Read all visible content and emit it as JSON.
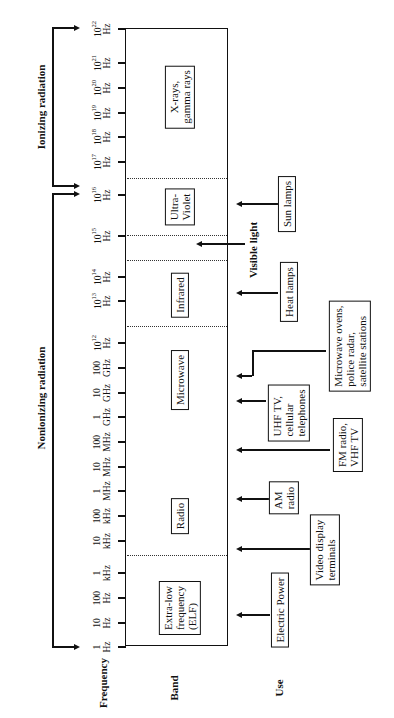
{
  "diagram": {
    "column_headers": {
      "frequency": "Frequency",
      "band": "Band",
      "use": "Use"
    },
    "radiation_groups": [
      {
        "label": "Ionizing radiation",
        "from": "10^16 Hz",
        "to": "10^22 Hz"
      },
      {
        "label": "Nonionizing radiation",
        "from": "1 Hz",
        "to": "10^16 Hz"
      }
    ],
    "frequency_ticks": [
      {
        "top": "10",
        "sup": "22",
        "unit": "Hz",
        "y": 28
      },
      {
        "top": "10",
        "sup": "21",
        "unit": "Hz",
        "y": 62
      },
      {
        "top": "10",
        "sup": "20",
        "unit": "Hz",
        "y": 87
      },
      {
        "top": "10",
        "sup": "19",
        "unit": "Hz",
        "y": 112
      },
      {
        "top": "10",
        "sup": "18",
        "unit": "Hz",
        "y": 136
      },
      {
        "top": "10",
        "sup": "17",
        "unit": "Hz",
        "y": 161
      },
      {
        "top": "10",
        "sup": "16",
        "unit": "Hz",
        "y": 194
      },
      {
        "top": "10",
        "sup": "15",
        "unit": "Hz",
        "y": 235
      },
      {
        "top": "10",
        "sup": "14",
        "unit": "Hz",
        "y": 276
      },
      {
        "top": "10",
        "sup": "13",
        "unit": "Hz",
        "y": 300
      },
      {
        "top": "10",
        "sup": "12",
        "unit": "Hz",
        "y": 342
      },
      {
        "top": "100",
        "sup": "",
        "unit": "GHz",
        "y": 367
      },
      {
        "top": "10",
        "sup": "",
        "unit": "GHz",
        "y": 392
      },
      {
        "top": "1",
        "sup": "",
        "unit": "GHz",
        "y": 416
      },
      {
        "top": "100",
        "sup": "",
        "unit": "MHz",
        "y": 441
      },
      {
        "top": "10",
        "sup": "",
        "unit": "MHz",
        "y": 466
      },
      {
        "top": "1",
        "sup": "",
        "unit": "MHz",
        "y": 490
      },
      {
        "top": "100",
        "sup": "",
        "unit": "kHz",
        "y": 515
      },
      {
        "top": "10",
        "sup": "",
        "unit": "kHz",
        "y": 540
      },
      {
        "top": "1",
        "sup": "",
        "unit": "kHz",
        "y": 572
      },
      {
        "top": "100",
        "sup": "",
        "unit": "Hz",
        "y": 597
      },
      {
        "top": "10",
        "sup": "",
        "unit": "Hz",
        "y": 622
      },
      {
        "top": "1",
        "sup": "",
        "unit": "Hz",
        "y": 646
      }
    ],
    "bands": [
      {
        "label": "X-rays, gamma rays",
        "line1": "X-rays,",
        "line2": "gamma rays"
      },
      {
        "label": "Ultra-Violet",
        "line1": "Ultra-",
        "line2": "Violet"
      },
      {
        "label": "Infrared",
        "line1": "Infrared",
        "line2": ""
      },
      {
        "label": "Microwave",
        "line1": "Microwave",
        "line2": ""
      },
      {
        "label": "Radio",
        "line1": "Radio",
        "line2": ""
      },
      {
        "label": "Extra-low frequency (ELF)",
        "line1": "Extra-low",
        "line2": "frequency",
        "line3": "(ELF)"
      }
    ],
    "visible_light": "Visible light",
    "uses": [
      {
        "label": "Sun lamps",
        "line1": "Sun lamps"
      },
      {
        "label": "Heat lamps",
        "line1": "Heat lamps"
      },
      {
        "label": "Microwave ovens, police radar, satellite stations",
        "line1": "Microwave ovens,",
        "line2": "police radar,",
        "line3": "satellite stations"
      },
      {
        "label": "UHF TV, cellular telephones",
        "line1": "UHF TV,",
        "line2": "cellular",
        "line3": "telephones"
      },
      {
        "label": "FM radio, VHF TV",
        "line1": "FM radio,",
        "line2": "VHF TV"
      },
      {
        "label": "AM radio",
        "line1": "AM",
        "line2": "radio"
      },
      {
        "label": "Video display terminals",
        "line1": "Video display",
        "line2": "terminals"
      },
      {
        "label": "Electric Power",
        "line1": "Electric Power"
      }
    ]
  }
}
